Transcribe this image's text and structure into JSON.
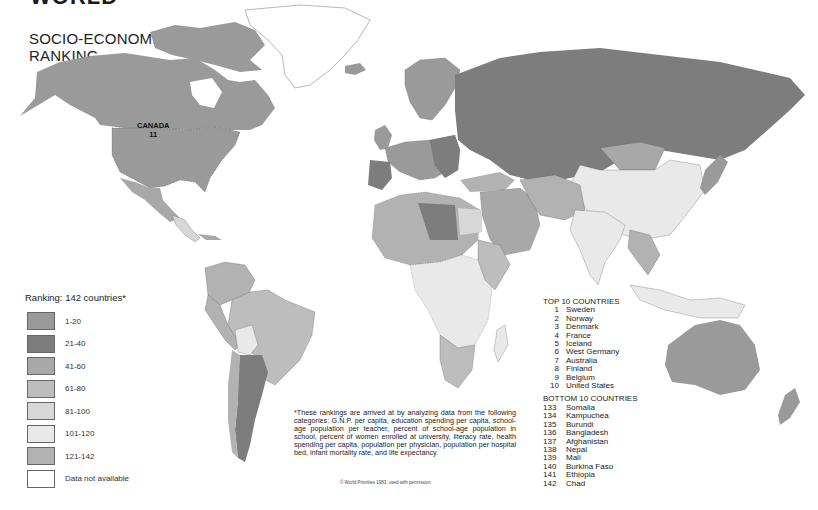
{
  "heading": "WORLD",
  "title_line1": "SOCIO-ECONOMIC",
  "title_line2": "RANKING",
  "canada_label": {
    "name": "CANADA",
    "rank": "11"
  },
  "legend": {
    "title": "Ranking: 142 countries*",
    "items": [
      {
        "label": "1-20",
        "color": "#9a9a9a"
      },
      {
        "label": "21-40",
        "color": "#7d7d7d"
      },
      {
        "label": "41-60",
        "color": "#a8a8a8"
      },
      {
        "label": "61-80",
        "color": "#bdbdbd"
      },
      {
        "label": "81-100",
        "color": "#d7d7d7"
      },
      {
        "label": "101-120",
        "color": "#e9e9e9"
      },
      {
        "label": "121-142",
        "color": "#b2b2b2"
      },
      {
        "label": "Data not available",
        "color": "#ffffff"
      }
    ]
  },
  "top10": {
    "heading": "TOP 10 COUNTRIES",
    "rows": [
      {
        "rank": "1",
        "name": "Sweden"
      },
      {
        "rank": "2",
        "name": "Norway"
      },
      {
        "rank": "3",
        "name": "Denmark"
      },
      {
        "rank": "4",
        "name": "France"
      },
      {
        "rank": "5",
        "name": "Iceland"
      },
      {
        "rank": "6",
        "name": "West Germany"
      },
      {
        "rank": "7",
        "name": "Australia"
      },
      {
        "rank": "8",
        "name": "Finland"
      },
      {
        "rank": "9",
        "name": "Belgium"
      },
      {
        "rank": "10",
        "name": "United States"
      }
    ]
  },
  "bottom10": {
    "heading": "BOTTOM 10 COUNTRIES",
    "rows": [
      {
        "rank": "133",
        "name": "Somalia"
      },
      {
        "rank": "134",
        "name": "Kampuchea"
      },
      {
        "rank": "135",
        "name": "Burundi"
      },
      {
        "rank": "136",
        "name": "Bangladesh"
      },
      {
        "rank": "137",
        "name": "Afghanistan"
      },
      {
        "rank": "138",
        "name": "Nepal"
      },
      {
        "rank": "139",
        "name": "Mali"
      },
      {
        "rank": "140",
        "name": "Burkina Faso"
      },
      {
        "rank": "141",
        "name": "Ethiopia"
      },
      {
        "rank": "142",
        "name": "Chad"
      }
    ]
  },
  "footnote": "*These rankings are arrived at by analyzing data from the following categories: G.N.P. per capita, education spending per capita, school-age population per teacher, percent of school-age population in school, percent of women enrolled at university, literacy rate, health spending per capita, population per physician, population per hospital bed, infant mortality rate, and life expectancy.",
  "credit": "© World Priorities 1983, used with permission"
}
